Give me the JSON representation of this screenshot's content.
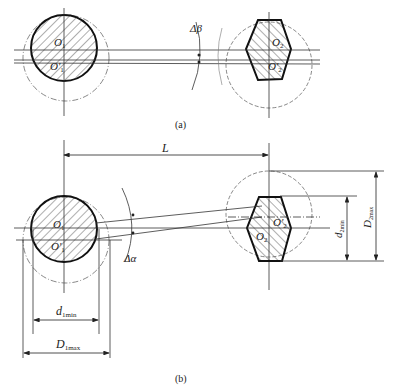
{
  "figure": {
    "panel_a": {
      "caption": "(a)",
      "left_part": {
        "center_label": "O",
        "center_sub": "1",
        "shifted_label": "O'",
        "shifted_sub": "1"
      },
      "right_part": {
        "center_label": "O",
        "center_sub": "2",
        "shifted_label": "O'",
        "shifted_sub": "2"
      },
      "angle_label": "Δβ"
    },
    "panel_b": {
      "caption": "(b)",
      "distance_label": "L",
      "angle_label": "Δα",
      "left_part": {
        "center_label": "O",
        "center_sub": "1",
        "shifted_label": "O'",
        "shifted_sub": "1"
      },
      "right_part": {
        "center_label": "O'",
        "center_sub": "2",
        "shifted_label": "O",
        "shifted_sub": "2"
      },
      "dims": {
        "d1min": {
          "main": "d",
          "sub": "1min"
        },
        "D1max": {
          "main": "D",
          "sub": "1max"
        },
        "d2min": {
          "main": "d",
          "sub": "2min"
        },
        "D2max": {
          "main": "D",
          "sub": "2max"
        }
      }
    }
  }
}
